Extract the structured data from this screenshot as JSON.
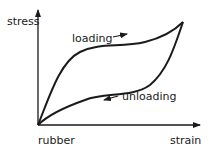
{
  "diagram": {
    "axes": {
      "y_label": "stress",
      "x_label": "strain",
      "origin_label": "rubber"
    },
    "curves": [
      {
        "name": "loading",
        "label": "loading",
        "arrow_direction": "right"
      },
      {
        "name": "unloading",
        "label": "unloading",
        "arrow_direction": "left"
      }
    ],
    "colors": {
      "line": "#1a1a1a",
      "background": "#ffffff"
    }
  }
}
